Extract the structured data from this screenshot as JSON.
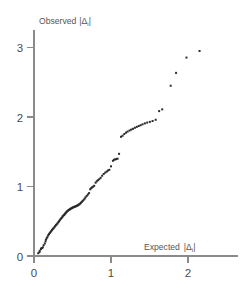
{
  "figure": {
    "background_color": "#ffffff",
    "axis_color": "#8a8a8a",
    "point_color": "#2b2b2b",
    "tick_label_color": "#4a4a4a"
  },
  "axes": {
    "x_title": "Expected",
    "x_title_symbol": "|Δ",
    "x_title_sub": "i",
    "x_title_symbol_end": "|",
    "y_title": "Observed",
    "y_title_symbol": "|Δ",
    "y_title_sub": "i",
    "y_title_symbol_end": "|",
    "x_ticks": [
      "0",
      "1",
      "2"
    ],
    "y_ticks": [
      "0",
      "1",
      "2",
      "3"
    ]
  },
  "chart_data": {
    "type": "scatter",
    "title": "",
    "subtitle": "",
    "xlabel": "Expected |Δi|",
    "ylabel": "Observed |Δi|",
    "xlim": [
      0,
      2.42
    ],
    "ylim": [
      0,
      3.27
    ],
    "xticks": [
      0,
      1,
      2
    ],
    "yticks": [
      0,
      1,
      2,
      3
    ],
    "grid": false,
    "legend": null,
    "legend_position": null,
    "marker": "square",
    "marker_size_px": 2,
    "point_count": 118,
    "annotations": [],
    "points": [
      [
        0.055,
        0.04
      ],
      [
        0.07,
        0.055
      ],
      [
        0.075,
        0.075
      ],
      [
        0.09,
        0.1
      ],
      [
        0.095,
        0.11
      ],
      [
        0.105,
        0.115
      ],
      [
        0.115,
        0.125
      ],
      [
        0.125,
        0.155
      ],
      [
        0.14,
        0.18
      ],
      [
        0.15,
        0.21
      ],
      [
        0.155,
        0.235
      ],
      [
        0.165,
        0.255
      ],
      [
        0.175,
        0.275
      ],
      [
        0.185,
        0.3
      ],
      [
        0.195,
        0.315
      ],
      [
        0.205,
        0.33
      ],
      [
        0.215,
        0.345
      ],
      [
        0.225,
        0.36
      ],
      [
        0.235,
        0.375
      ],
      [
        0.245,
        0.39
      ],
      [
        0.255,
        0.4
      ],
      [
        0.265,
        0.415
      ],
      [
        0.275,
        0.43
      ],
      [
        0.285,
        0.445
      ],
      [
        0.295,
        0.455
      ],
      [
        0.305,
        0.47
      ],
      [
        0.315,
        0.485
      ],
      [
        0.325,
        0.5
      ],
      [
        0.335,
        0.515
      ],
      [
        0.345,
        0.53
      ],
      [
        0.355,
        0.545
      ],
      [
        0.365,
        0.555
      ],
      [
        0.372,
        0.57
      ],
      [
        0.38,
        0.58
      ],
      [
        0.39,
        0.59
      ],
      [
        0.398,
        0.6
      ],
      [
        0.405,
        0.61
      ],
      [
        0.412,
        0.62
      ],
      [
        0.42,
        0.63
      ],
      [
        0.428,
        0.64
      ],
      [
        0.436,
        0.648
      ],
      [
        0.444,
        0.655
      ],
      [
        0.452,
        0.662
      ],
      [
        0.46,
        0.668
      ],
      [
        0.468,
        0.674
      ],
      [
        0.476,
        0.68
      ],
      [
        0.484,
        0.685
      ],
      [
        0.492,
        0.69
      ],
      [
        0.5,
        0.695
      ],
      [
        0.508,
        0.7
      ],
      [
        0.516,
        0.703
      ],
      [
        0.524,
        0.707
      ],
      [
        0.532,
        0.71
      ],
      [
        0.54,
        0.714
      ],
      [
        0.548,
        0.718
      ],
      [
        0.556,
        0.722
      ],
      [
        0.564,
        0.727
      ],
      [
        0.572,
        0.732
      ],
      [
        0.58,
        0.738
      ],
      [
        0.59,
        0.745
      ],
      [
        0.6,
        0.755
      ],
      [
        0.61,
        0.765
      ],
      [
        0.62,
        0.778
      ],
      [
        0.632,
        0.792
      ],
      [
        0.645,
        0.808
      ],
      [
        0.658,
        0.825
      ],
      [
        0.67,
        0.845
      ],
      [
        0.685,
        0.865
      ],
      [
        0.7,
        0.885
      ],
      [
        0.715,
        0.905
      ],
      [
        0.73,
        0.96
      ],
      [
        0.742,
        0.975
      ],
      [
        0.755,
        0.988
      ],
      [
        0.768,
        0.998
      ],
      [
        0.782,
        1.01
      ],
      [
        0.8,
        1.055
      ],
      [
        0.815,
        1.075
      ],
      [
        0.83,
        1.09
      ],
      [
        0.848,
        1.105
      ],
      [
        0.865,
        1.125
      ],
      [
        0.885,
        1.155
      ],
      [
        0.905,
        1.18
      ],
      [
        0.925,
        1.2
      ],
      [
        0.945,
        1.215
      ],
      [
        0.96,
        1.23
      ],
      [
        0.978,
        1.24
      ],
      [
        1.0,
        1.29
      ],
      [
        1.025,
        1.37
      ],
      [
        1.04,
        1.385
      ],
      [
        1.055,
        1.39
      ],
      [
        1.07,
        1.395
      ],
      [
        1.085,
        1.4
      ],
      [
        1.105,
        1.47
      ],
      [
        1.13,
        1.715
      ],
      [
        1.15,
        1.73
      ],
      [
        1.172,
        1.755
      ],
      [
        1.195,
        1.775
      ],
      [
        1.215,
        1.79
      ],
      [
        1.24,
        1.805
      ],
      [
        1.262,
        1.818
      ],
      [
        1.285,
        1.83
      ],
      [
        1.31,
        1.845
      ],
      [
        1.335,
        1.858
      ],
      [
        1.36,
        1.87
      ],
      [
        1.385,
        1.882
      ],
      [
        1.41,
        1.895
      ],
      [
        1.44,
        1.908
      ],
      [
        1.47,
        1.92
      ],
      [
        1.505,
        1.93
      ],
      [
        1.54,
        1.942
      ],
      [
        1.58,
        1.96
      ],
      [
        1.625,
        2.085
      ],
      [
        1.665,
        2.11
      ],
      [
        1.775,
        2.45
      ],
      [
        1.845,
        2.635
      ],
      [
        1.98,
        2.855
      ],
      [
        2.15,
        2.95
      ]
    ]
  },
  "geometry": {
    "origin_x_px": 34,
    "origin_y_px": 256,
    "x_unit_px": 77,
    "y_unit_px": 69.5
  }
}
